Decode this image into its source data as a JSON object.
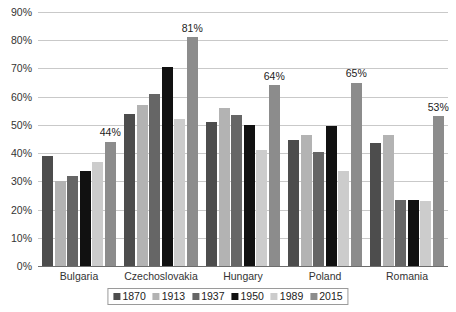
{
  "chart_data": {
    "type": "bar",
    "title": "",
    "subtitle": "",
    "xlabel": "",
    "ylabel": "",
    "ylim": [
      0,
      90
    ],
    "ytick_labels": [
      "0%",
      "10%",
      "20%",
      "30%",
      "40%",
      "50%",
      "60%",
      "70%",
      "80%",
      "90%"
    ],
    "ytick_values": [
      0,
      10,
      20,
      30,
      40,
      50,
      60,
      70,
      80,
      90
    ],
    "grid": true,
    "legend_position": "bottom",
    "categories": [
      "Bulgaria",
      "Czechoslovakia",
      "Hungary",
      "Poland",
      "Romania"
    ],
    "series": [
      {
        "name": "1870",
        "color": "#4d4d4d",
        "values": [
          39,
          54,
          51,
          44.5,
          43.5
        ]
      },
      {
        "name": "1913",
        "color": "#b3b3b3",
        "values": [
          30,
          57,
          56,
          46.5,
          46.5
        ]
      },
      {
        "name": "1937",
        "color": "#666666",
        "values": [
          32,
          61,
          53.5,
          40.5,
          23.5
        ]
      },
      {
        "name": "1950",
        "color": "#111111",
        "values": [
          33.5,
          70.5,
          50,
          49.5,
          23.5
        ]
      },
      {
        "name": "1989",
        "color": "#cccccc",
        "values": [
          37,
          52,
          41,
          33.5,
          23
        ]
      },
      {
        "name": "2015",
        "color": "#8c8c8c",
        "values": [
          44,
          81,
          64,
          65,
          53
        ]
      }
    ],
    "annotations": [
      {
        "category": "Bulgaria",
        "series": "2015",
        "text": "44%"
      },
      {
        "category": "Czechoslovakia",
        "series": "2015",
        "text": "81%"
      },
      {
        "category": "Hungary",
        "series": "2015",
        "text": "64%"
      },
      {
        "category": "Poland",
        "series": "2015",
        "text": "65%"
      },
      {
        "category": "Romania",
        "series": "2015",
        "text": "53%"
      }
    ]
  },
  "colors": {
    "gridline": "#c9c9c9",
    "axis": "#6d6d6d",
    "text": "#333333",
    "legend_border": "#9a9a9a",
    "background": "#ffffff"
  }
}
